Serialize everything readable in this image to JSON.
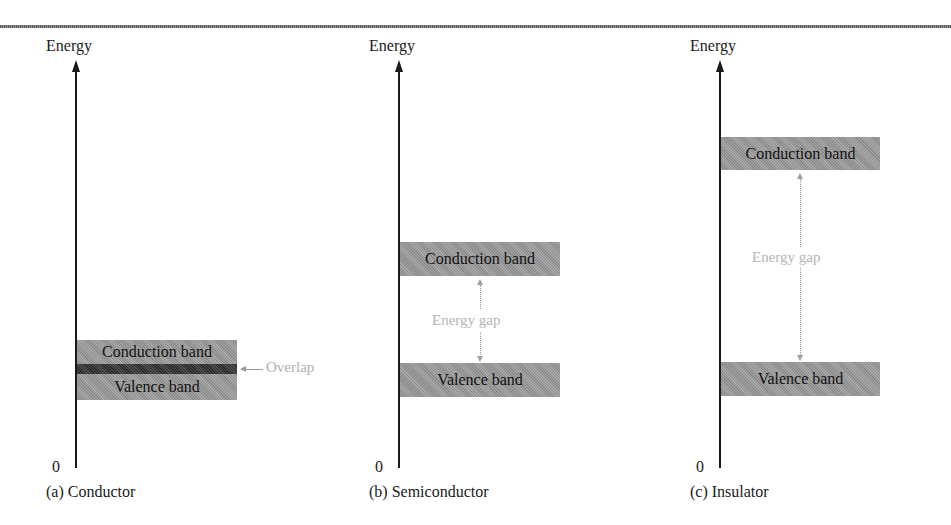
{
  "figure": {
    "axis_label": "Energy",
    "origin_label": "0",
    "panels": [
      {
        "id": "a",
        "caption": "(a) Conductor",
        "bands": {
          "conduction": "Conduction band",
          "valence": "Valence band"
        },
        "annotation": "Overlap"
      },
      {
        "id": "b",
        "caption": "(b) Semiconductor",
        "bands": {
          "conduction": "Conduction band",
          "valence": "Valence band"
        },
        "annotation": "Energy gap"
      },
      {
        "id": "c",
        "caption": "(c) Insulator",
        "bands": {
          "conduction": "Conduction band",
          "valence": "Valence band"
        },
        "annotation": "Energy gap"
      }
    ]
  },
  "colors": {
    "band_fill": "#9a9a9a",
    "overlap_fill": "#3c3c3c",
    "annotation_text": "#b5b5b5",
    "axis": "#1a1a1a"
  }
}
